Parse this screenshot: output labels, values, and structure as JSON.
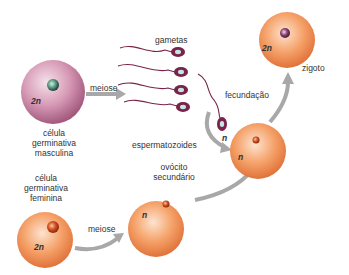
{
  "diagram": {
    "nodes": {
      "male_germ_cell": {
        "label_lines": [
          "célula",
          "germinativa",
          "masculina"
        ],
        "ploidy": "2n"
      },
      "female_germ_cell": {
        "label_lines": [
          "célula",
          "germinativa",
          "feminina"
        ],
        "ploidy": "2n"
      },
      "secondary_oocyte": {
        "label_lines": [
          "ovócito",
          "secundário"
        ],
        "ploidy": "n"
      },
      "egg_fertilized": {
        "ploidy": "n"
      },
      "zygote": {
        "label": "zigoto",
        "ploidy": "2n"
      },
      "sperm": {
        "label_top": "gametas",
        "label_bottom": "espermatozoides",
        "ploidy": "n",
        "count": 5
      }
    },
    "edges": {
      "male_meiosis": "meiose",
      "female_meiosis": "meiose",
      "fertilization": "fecundação"
    },
    "colors": {
      "male_cell": "#c97fa0",
      "female_cell": "#ef8a4a",
      "sperm": "#7a2248",
      "arrow": "#a8a8a8",
      "text": "#333333"
    }
  }
}
